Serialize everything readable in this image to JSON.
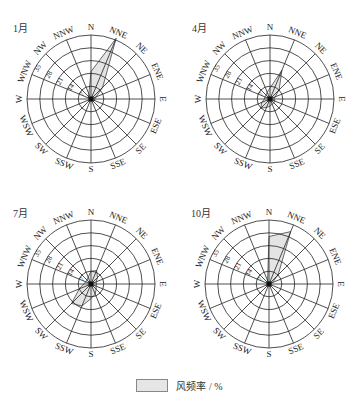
{
  "chart_data": [
    {
      "type": "radar",
      "title": "1月",
      "directions": [
        "N",
        "NNE",
        "NE",
        "ENE",
        "E",
        "ESE",
        "SE",
        "SSE",
        "S",
        "SSW",
        "SW",
        "WSW",
        "W",
        "WNW",
        "NW",
        "NNW"
      ],
      "radial_ticks": [
        7,
        14,
        21,
        28,
        35
      ],
      "rlim": [
        0,
        35
      ],
      "values": [
        15,
        36,
        9,
        3,
        2,
        2,
        1,
        1,
        1,
        1,
        1,
        1,
        1,
        1,
        2,
        3
      ],
      "series_name": "风频率 / %"
    },
    {
      "type": "radar",
      "title": "4月",
      "directions": [
        "N",
        "NNE",
        "NE",
        "ENE",
        "E",
        "ESE",
        "SE",
        "SSE",
        "S",
        "SSW",
        "SW",
        "WSW",
        "W",
        "WNW",
        "NW",
        "NNW"
      ],
      "radial_ticks": [
        7,
        14,
        21,
        28,
        35
      ],
      "rlim": [
        0,
        35
      ],
      "values": [
        6,
        17,
        7,
        3,
        2,
        3,
        3,
        3,
        4,
        5,
        7,
        5,
        3,
        3,
        3,
        4
      ],
      "series_name": "风频率 / %"
    },
    {
      "type": "radar",
      "title": "7月",
      "directions": [
        "N",
        "NNE",
        "NE",
        "ENE",
        "E",
        "ESE",
        "SE",
        "SSE",
        "S",
        "SSW",
        "SW",
        "WSW",
        "W",
        "WNW",
        "NW",
        "NNW"
      ],
      "radial_ticks": [
        7,
        14,
        21,
        28,
        35
      ],
      "rlim": [
        0,
        35
      ],
      "values": [
        7,
        8,
        5,
        3,
        3,
        3,
        4,
        6,
        8,
        13,
        15,
        7,
        4,
        3,
        3,
        4
      ],
      "series_name": "风频率 / %"
    },
    {
      "type": "radar",
      "title": "10月",
      "directions": [
        "N",
        "NNE",
        "NE",
        "ENE",
        "E",
        "ESE",
        "SE",
        "SSE",
        "S",
        "SSW",
        "SW",
        "WSW",
        "W",
        "WNW",
        "NW",
        "NNW"
      ],
      "radial_ticks": [
        7,
        14,
        21,
        28,
        35
      ],
      "rlim": [
        0,
        35
      ],
      "values": [
        26,
        31,
        7,
        2,
        1,
        1,
        1,
        1,
        1,
        1,
        1,
        1,
        1,
        1,
        1,
        2
      ],
      "series_name": "风频率 / %"
    }
  ],
  "panels": [
    {
      "month": "1月",
      "cx": 91,
      "cy": 99
    },
    {
      "month": "4月",
      "cx": 270,
      "cy": 99
    },
    {
      "month": "7月",
      "cx": 91,
      "cy": 284
    },
    {
      "month": "10月",
      "cx": 269,
      "cy": 284
    }
  ],
  "legend": {
    "label": "风频率 / %",
    "fill": "#e6e6e6"
  },
  "colors": {
    "grid": "#222222",
    "fill": "#e4e4e4",
    "stroke": "#444444"
  }
}
